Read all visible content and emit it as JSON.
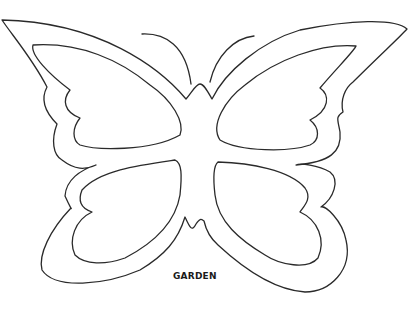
{
  "image": {
    "subject": "butterfly coloring page outline",
    "caption": "GARDEN",
    "colors": {
      "background": "#ffffff",
      "line": "#2a2a2a",
      "text": "#1a1a1a"
    }
  }
}
